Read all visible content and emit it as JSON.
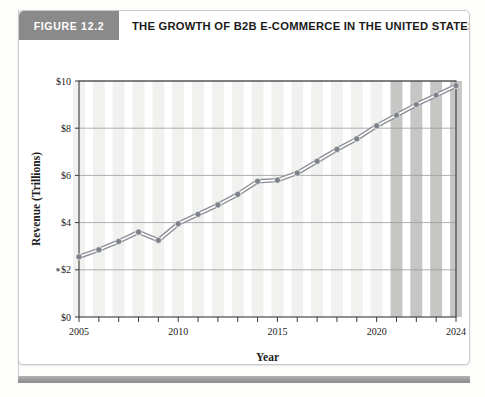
{
  "figure": {
    "badge_label": "FIGURE 12.2",
    "title": "THE GROWTH OF B2B E-COMMERCE IN THE UNITED STATES"
  },
  "colors": {
    "badge_bg": "#8a8a8a",
    "title_text": "#1a1a1a",
    "line": "#8c8f96",
    "marker": "#7e828a",
    "bar_light": "#f1f1ef",
    "bar_dark": "#c6c6c4",
    "gridline": "#9a9a9a",
    "axis": "#3a3a3a",
    "footer_bar": "#9a9a9a"
  },
  "chart_data": {
    "type": "line",
    "title": "THE GROWTH OF B2B E-COMMERCE IN THE UNITED STATES",
    "xlabel": "Year",
    "ylabel": "Revenue (Trillions)",
    "xlim": [
      2005,
      2024
    ],
    "ylim": [
      0,
      10
    ],
    "ytick_values": [
      0,
      2,
      4,
      6,
      8,
      10
    ],
    "ytick_labels": [
      "$0",
      "$2",
      "$4",
      "$6",
      "$8",
      "$10"
    ],
    "xtick_values": [
      2005,
      2010,
      2015,
      2020,
      2024
    ],
    "xtick_labels": [
      "2005",
      "2010",
      "2015",
      "2020",
      "2024"
    ],
    "grid": true,
    "legend": false,
    "marker": "circle",
    "x": [
      2005,
      2006,
      2007,
      2008,
      2009,
      2010,
      2011,
      2012,
      2013,
      2014,
      2015,
      2016,
      2017,
      2018,
      2019,
      2020,
      2021,
      2022,
      2023,
      2024
    ],
    "values": [
      2.55,
      2.85,
      3.2,
      3.6,
      3.25,
      3.95,
      4.35,
      4.75,
      5.2,
      5.75,
      5.8,
      6.1,
      6.6,
      7.1,
      7.55,
      8.1,
      8.55,
      9.0,
      9.4,
      9.8
    ],
    "highlighted_years": [
      2021,
      2022,
      2023,
      2024
    ],
    "highlight_note": "projected"
  }
}
